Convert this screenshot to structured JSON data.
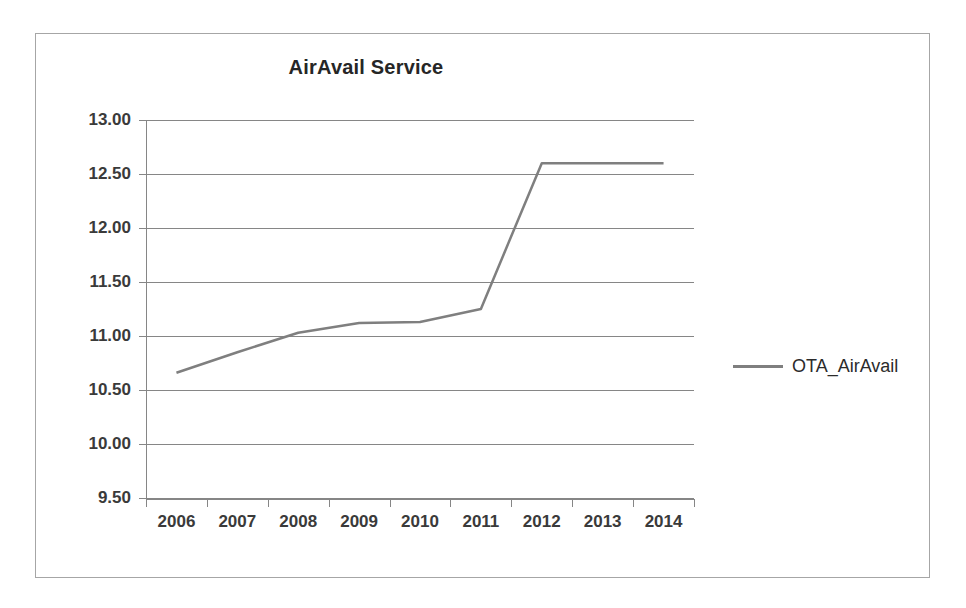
{
  "chart_data": {
    "type": "line",
    "title": "AirAvail Service",
    "xlabel": "",
    "ylabel": "",
    "categories": [
      "2006",
      "2007",
      "2008",
      "2009",
      "2010",
      "2011",
      "2012",
      "2013",
      "2014"
    ],
    "series": [
      {
        "name": "OTA_AirAvail",
        "color": "#7f7f7f",
        "values": [
          10.66,
          10.85,
          11.03,
          11.12,
          11.13,
          11.25,
          12.6,
          12.6,
          12.6
        ]
      }
    ],
    "ylim": [
      9.5,
      13.0
    ],
    "ytick_labels": [
      "13.00",
      "12.50",
      "12.00",
      "11.50",
      "11.00",
      "10.50",
      "10.00",
      "9.50"
    ],
    "ytick_values": [
      13.0,
      12.5,
      12.0,
      11.5,
      11.0,
      10.5,
      10.0,
      9.5
    ],
    "grid": true,
    "legend_position": "right",
    "legend_entries": [
      "OTA_AirAvail"
    ]
  },
  "legend": {
    "label": "OTA_AirAvail"
  },
  "colors": {
    "series_line": "#7f7f7f",
    "gridline": "#868686",
    "axis": "#868686",
    "text": "#3a3a3a",
    "title": "#262626",
    "frame_border": "#a6a6a6"
  }
}
